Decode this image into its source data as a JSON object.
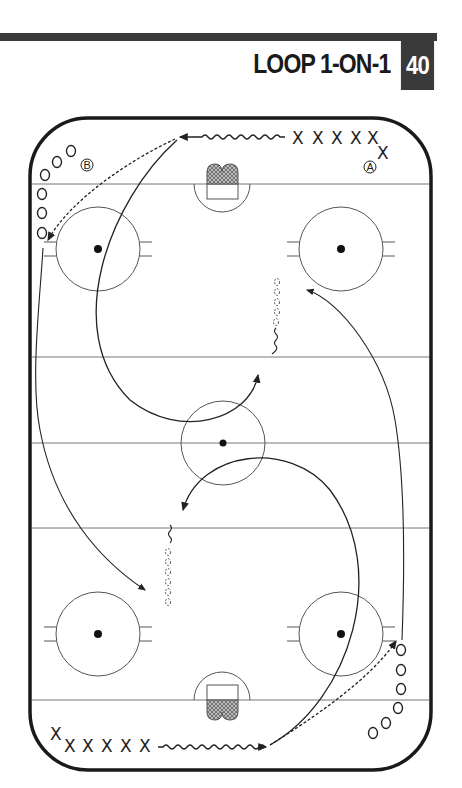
{
  "header": {
    "title": "LOOP 1-ON-1",
    "drill_number": "40",
    "bar_color": "#3a3a3a"
  },
  "diagram": {
    "type": "hockey-rink-drill",
    "player_labels": {
      "group_a": "A",
      "group_b": "B"
    },
    "offense_symbol": "X",
    "defense_symbol": "O",
    "top_x_row": [
      "X",
      "X",
      "X",
      "X",
      "X",
      "X"
    ],
    "bottom_x_row": [
      "X",
      "X",
      "X",
      "X",
      "X",
      "X"
    ],
    "legend_lines": {
      "solid": "skater path",
      "wavy": "skating with puck",
      "dashed": "pass",
      "dotted-circles": "pylons / backward skating"
    },
    "line_color": "#333333"
  }
}
